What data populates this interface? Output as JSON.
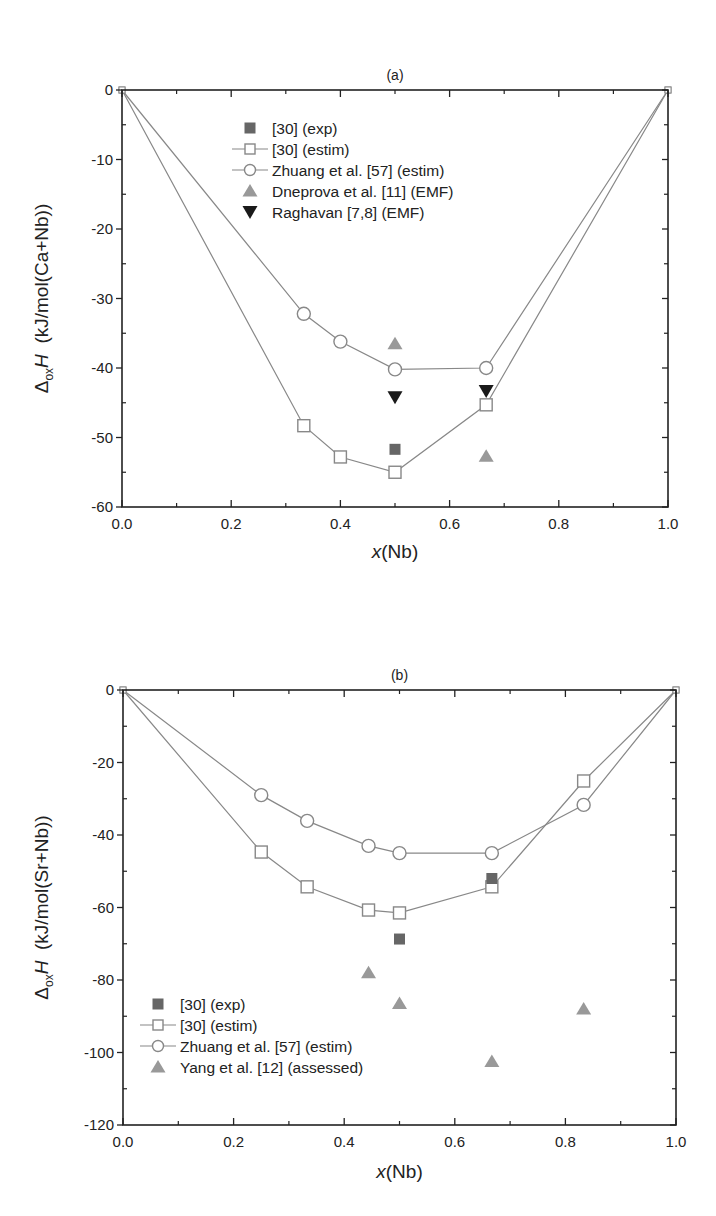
{
  "chart_data": [
    {
      "type": "scatter",
      "panel": "(a)",
      "title": "(a)",
      "xlabel_italic": "x",
      "xlabel_rest": "(Nb)",
      "ylabel_delta": "Δ",
      "ylabel_sub": "ox",
      "ylabel_H": "H",
      "ylabel_units": "(kJ/mol(Ca+Nb))",
      "xlim": [
        0.0,
        1.0
      ],
      "ylim": [
        -60,
        0
      ],
      "xticks": [
        "0.0",
        "0.2",
        "0.4",
        "0.6",
        "0.8",
        "1.0"
      ],
      "yticks": [
        "0",
        "-10",
        "-20",
        "-30",
        "-40",
        "-50",
        "-60"
      ],
      "legend_position": "upper center",
      "series": [
        {
          "name": "[30] (exp)",
          "marker": "filled-square",
          "color": "#666666",
          "line": false,
          "points": [
            [
              0.5,
              -51.7
            ]
          ]
        },
        {
          "name": "[30] (estim)",
          "marker": "open-square",
          "color": "#888888",
          "line": true,
          "points": [
            [
              0.0,
              0.0
            ],
            [
              0.333,
              -48.3
            ],
            [
              0.4,
              -52.8
            ],
            [
              0.5,
              -55.0
            ],
            [
              0.667,
              -45.3
            ],
            [
              1.0,
              0.0
            ]
          ]
        },
        {
          "name": "Zhuang et al. [57] (estim)",
          "marker": "open-circle",
          "color": "#888888",
          "line": true,
          "points": [
            [
              0.0,
              0.0
            ],
            [
              0.333,
              -32.2
            ],
            [
              0.4,
              -36.2
            ],
            [
              0.5,
              -40.2
            ],
            [
              0.667,
              -40.0
            ],
            [
              1.0,
              0.0
            ]
          ]
        },
        {
          "name": "Dneprova et al. [11] (EMF)",
          "marker": "triangle-up",
          "color": "#999999",
          "line": false,
          "points": [
            [
              0.5,
              -36.5
            ],
            [
              0.667,
              -52.7
            ]
          ]
        },
        {
          "name": "Raghavan [7,8] (EMF)",
          "marker": "triangle-down",
          "color": "#1a1a1a",
          "line": false,
          "points": [
            [
              0.5,
              -44.2
            ],
            [
              0.667,
              -43.3
            ]
          ]
        }
      ]
    },
    {
      "type": "scatter",
      "panel": "(b)",
      "title": "(b)",
      "xlabel_italic": "x",
      "xlabel_rest": "(Nb)",
      "ylabel_delta": "Δ",
      "ylabel_sub": "ox",
      "ylabel_H": "H",
      "ylabel_units": "(kJ/mol(Sr+Nb))",
      "xlim": [
        0.0,
        1.0
      ],
      "ylim": [
        -120,
        0
      ],
      "xticks": [
        "0.0",
        "0.2",
        "0.4",
        "0.6",
        "0.8",
        "1.0"
      ],
      "yticks": [
        "0",
        "-20",
        "-40",
        "-60",
        "-80",
        "-100",
        "-120"
      ],
      "legend_position": "lower left",
      "series": [
        {
          "name": "[30] (exp)",
          "marker": "filled-square",
          "color": "#666666",
          "line": false,
          "points": [
            [
              0.5,
              -68.7
            ],
            [
              0.667,
              -52.0
            ]
          ]
        },
        {
          "name": "[30] (estim)",
          "marker": "open-square",
          "color": "#888888",
          "line": true,
          "points": [
            [
              0.0,
              0.0
            ],
            [
              0.25,
              -44.7
            ],
            [
              0.333,
              -54.3
            ],
            [
              0.444,
              -60.7
            ],
            [
              0.5,
              -61.5
            ],
            [
              0.667,
              -54.3
            ],
            [
              0.833,
              -25.1
            ],
            [
              1.0,
              0.0
            ]
          ]
        },
        {
          "name": "Zhuang et al. [57] (estim)",
          "marker": "open-circle",
          "color": "#888888",
          "line": true,
          "points": [
            [
              0.0,
              0.0
            ],
            [
              0.25,
              -29.0
            ],
            [
              0.333,
              -36.1
            ],
            [
              0.444,
              -43.0
            ],
            [
              0.5,
              -45.0
            ],
            [
              0.667,
              -45.0
            ],
            [
              0.833,
              -31.7
            ],
            [
              1.0,
              0.0
            ]
          ]
        },
        {
          "name": "Yang et al. [12] (assessed)",
          "marker": "triangle-up",
          "color": "#999999",
          "line": false,
          "points": [
            [
              0.444,
              -78.0
            ],
            [
              0.5,
              -86.5
            ],
            [
              0.667,
              -102.5
            ],
            [
              0.833,
              -88.0
            ]
          ]
        }
      ]
    }
  ]
}
